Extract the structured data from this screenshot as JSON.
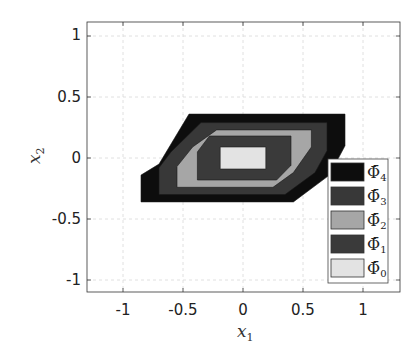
{
  "chart_data": {
    "type": "area",
    "title": "",
    "xlabel": "x_1",
    "ylabel": "x_2",
    "xlim": [
      -1.3,
      1.3
    ],
    "ylim": [
      -1.1,
      1.1
    ],
    "xticks": [
      "-1",
      "-0.5",
      "0",
      "0.5",
      "1"
    ],
    "yticks": [
      "1",
      "0.5",
      "0",
      "-0.5",
      "-1"
    ],
    "grid": true,
    "legend_position": "lower right",
    "series": [
      {
        "name": "Φ̄4",
        "color": "#0d0d0d",
        "polygon": [
          [
            -0.85,
            -0.36
          ],
          [
            0.42,
            -0.36
          ],
          [
            0.72,
            -0.14
          ],
          [
            0.85,
            0.1
          ],
          [
            0.85,
            0.36
          ],
          [
            -0.45,
            0.36
          ],
          [
            -0.7,
            -0.05
          ],
          [
            -0.85,
            -0.14
          ]
        ]
      },
      {
        "name": "Φ̄3",
        "color": "#383838",
        "polygon": [
          [
            -0.7,
            -0.3
          ],
          [
            0.35,
            -0.3
          ],
          [
            0.6,
            -0.12
          ],
          [
            0.7,
            0.06
          ],
          [
            0.7,
            0.29
          ],
          [
            -0.35,
            0.29
          ],
          [
            -0.6,
            0.05
          ],
          [
            -0.7,
            -0.08
          ]
        ]
      },
      {
        "name": "Φ̄2",
        "color": "#a6a6a6",
        "polygon": [
          [
            -0.55,
            -0.24
          ],
          [
            0.25,
            -0.24
          ],
          [
            0.42,
            -0.12
          ],
          [
            0.57,
            0.09
          ],
          [
            0.57,
            0.23
          ],
          [
            -0.22,
            0.23
          ],
          [
            -0.42,
            0.09
          ],
          [
            -0.55,
            -0.07
          ]
        ]
      },
      {
        "name": "Φ̄1",
        "color": "#3a3a3a",
        "polygon": [
          [
            -0.38,
            -0.18
          ],
          [
            0.28,
            -0.18
          ],
          [
            0.4,
            -0.06
          ],
          [
            0.4,
            0.18
          ],
          [
            -0.28,
            0.18
          ],
          [
            -0.38,
            0.05
          ]
        ]
      },
      {
        "name": "Φ̄0",
        "color": "#e3e3e3",
        "polygon": [
          [
            -0.19,
            -0.09
          ],
          [
            0.19,
            -0.09
          ],
          [
            0.19,
            0.09
          ],
          [
            -0.19,
            0.09
          ]
        ]
      }
    ]
  },
  "legend": {
    "items": [
      {
        "label": "Φ̄",
        "sub": "4",
        "color": "#0d0d0d"
      },
      {
        "label": "Φ̄",
        "sub": "3",
        "color": "#383838"
      },
      {
        "label": "Φ̄",
        "sub": "2",
        "color": "#a6a6a6"
      },
      {
        "label": "Φ̄",
        "sub": "1",
        "color": "#3a3a3a"
      },
      {
        "label": "Φ̄",
        "sub": "0",
        "color": "#e3e3e3"
      }
    ]
  },
  "axes": {
    "xlabel_main": "x",
    "xlabel_sub": "1",
    "ylabel_main": "x",
    "ylabel_sub": "2",
    "xticks": [
      "-1",
      "-0.5",
      "0",
      "0.5",
      "1"
    ],
    "yticks": [
      "1",
      "0.5",
      "0",
      "-0.5",
      "-1"
    ]
  }
}
